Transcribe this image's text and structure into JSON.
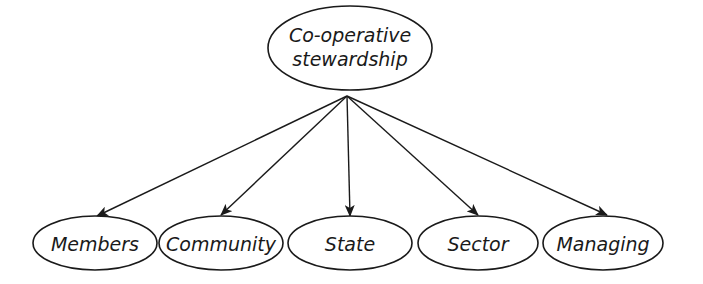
{
  "diagram": {
    "type": "tree",
    "root": {
      "id": "root",
      "label_lines": [
        "Co-operative",
        "stewardship"
      ],
      "cx": 350,
      "cy": 48,
      "rx": 82,
      "ry": 42
    },
    "children": [
      {
        "id": "members",
        "label": "Members",
        "cx": 95,
        "cy": 243,
        "rx": 62,
        "ry": 27,
        "tip": [
          97,
          216
        ]
      },
      {
        "id": "community",
        "label": "Community",
        "cx": 221,
        "cy": 243,
        "rx": 62,
        "ry": 27,
        "tip": [
          221,
          215
        ]
      },
      {
        "id": "state",
        "label": "State",
        "cx": 350,
        "cy": 243,
        "rx": 62,
        "ry": 27,
        "tip": [
          350,
          216
        ]
      },
      {
        "id": "sector",
        "label": "Sector",
        "cx": 478,
        "cy": 243,
        "rx": 60,
        "ry": 27,
        "tip": [
          478,
          215
        ]
      },
      {
        "id": "managing",
        "label": "Managing",
        "cx": 603,
        "cy": 243,
        "rx": 60,
        "ry": 27,
        "tip": [
          607,
          215
        ]
      }
    ],
    "edge_origin": [
      347,
      96
    ],
    "colors": {
      "stroke": "#1a1a1a",
      "fill": "#ffffff",
      "text": "#1a1a1a"
    }
  }
}
